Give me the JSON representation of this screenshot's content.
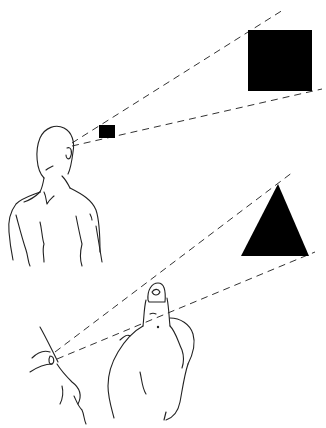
{
  "figure": {
    "colors": {
      "background": "#ffffff",
      "ink": "#222222",
      "fill": "#000000"
    }
  },
  "scene_top": {
    "viewer": "person-from-behind",
    "eye": [
      72,
      143
    ],
    "near_object": {
      "shape": "square",
      "x": 99,
      "y": 125,
      "w": 16,
      "h": 13
    },
    "far_object": {
      "shape": "square",
      "x": 248,
      "y": 30,
      "w": 64,
      "h": 61
    },
    "sight_lines": [
      {
        "x1": 72,
        "y1": 143,
        "x2": 283,
        "y2": 10
      },
      {
        "x1": 72,
        "y1": 146,
        "x2": 322,
        "y2": 89
      }
    ]
  },
  "scene_bottom": {
    "viewer": "eye-and-thumb",
    "eye": [
      52,
      360
    ],
    "near_object": {
      "shape": "thumb"
    },
    "far_object": {
      "shape": "triangle",
      "points": [
        [
          278,
          184
        ],
        [
          241,
          256
        ],
        [
          309,
          256
        ]
      ]
    },
    "sight_lines": [
      {
        "x1": 55,
        "y1": 352,
        "x2": 293,
        "y2": 172
      },
      {
        "x1": 57,
        "y1": 359,
        "x2": 315,
        "y2": 252
      }
    ]
  }
}
